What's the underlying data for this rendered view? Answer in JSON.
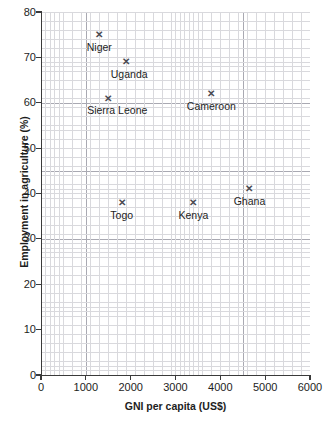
{
  "chart_data": {
    "type": "scatter",
    "title": "",
    "xlabel": "GNI per capita (US$)",
    "ylabel": "Employment in agriculture (%)",
    "xlim": [
      0,
      6000
    ],
    "ylim": [
      0,
      80
    ],
    "xticks": [
      0,
      1000,
      2000,
      3000,
      4000,
      5000,
      6000
    ],
    "yticks": [
      0,
      10,
      20,
      30,
      40,
      50,
      60,
      70,
      80
    ],
    "xtick_labels": [
      "0",
      "1000",
      "2000",
      "3000",
      "4000",
      "5000",
      "6000"
    ],
    "ytick_labels": [
      "0",
      "10",
      "20",
      "30",
      "40",
      "50",
      "60",
      "70",
      "80"
    ],
    "grid": true,
    "grid_major_x": 500,
    "grid_major_y": 5,
    "legend": "none",
    "marker": "x",
    "marker_color": "#4a4a52",
    "points": [
      {
        "label": "Niger",
        "x": 1300,
        "y": 75,
        "label_dx": 0,
        "label_dy": 7
      },
      {
        "label": "Uganda",
        "x": 1900,
        "y": 69,
        "label_dx": 3,
        "label_dy": 7
      },
      {
        "label": "Sierra Leone",
        "x": 1500,
        "y": 61,
        "label_dx": 9,
        "label_dy": 7
      },
      {
        "label": "Cameroon",
        "x": 3800,
        "y": 62,
        "label_dx": 0,
        "label_dy": 7
      },
      {
        "label": "Togo",
        "x": 1800,
        "y": 38,
        "label_dx": 0,
        "label_dy": 7
      },
      {
        "label": "Kenya",
        "x": 3400,
        "y": 38,
        "label_dx": 0,
        "label_dy": 7
      },
      {
        "label": "Ghana",
        "x": 4650,
        "y": 41,
        "label_dx": 0,
        "label_dy": 7
      }
    ]
  },
  "colors": {
    "marker": "#4a4a52",
    "grid_minor": "#d9d9dd",
    "grid_major": "#a9a9b2",
    "axis": "#3a3a3a",
    "text": "#1d1d1d",
    "background": "#ffffff"
  },
  "marker_glyph": "✕"
}
